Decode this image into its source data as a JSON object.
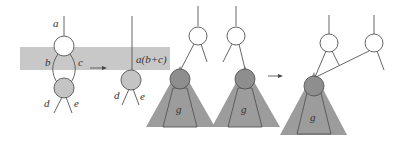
{
  "colors": {
    "band": "#c8c8c8",
    "triangle": "#9c9c9c",
    "node_shaded": "#c4c4c4",
    "node_dark": "#8e8e8e",
    "node_open": "#ffffff",
    "stroke": "#555555"
  },
  "panel1": {
    "labels": {
      "a": "a",
      "b": "b",
      "c": "c",
      "d": "d",
      "e": "e"
    }
  },
  "panel2": {
    "labels": {
      "merged": "a(b+c)",
      "d": "d",
      "e": "e"
    }
  },
  "panel3": {
    "labels": {
      "g1": "g",
      "g2": "g"
    }
  },
  "panel4": {
    "labels": {
      "g": "g"
    }
  }
}
